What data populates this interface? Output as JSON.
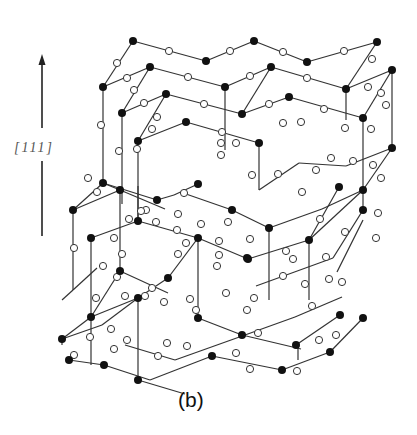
{
  "figure": {
    "caption": "(b)",
    "axis_label": "[111]",
    "colors": {
      "line": "#333333",
      "black_atom": "#111111",
      "white_atom_fill": "#ffffff",
      "white_atom_stroke": "#333333"
    }
  },
  "arrow": {
    "x": 42,
    "y_top": 54,
    "y_gap_top": 128,
    "y_gap_bottom": 161,
    "y_bottom": 236
  },
  "bonds": [
    [
      133,
      41,
      103,
      87
    ],
    [
      133,
      41,
      206,
      61
    ],
    [
      206,
      61,
      254,
      41
    ],
    [
      254,
      41,
      307,
      62
    ],
    [
      307,
      62,
      377,
      42
    ],
    [
      103,
      87,
      150,
      67
    ],
    [
      150,
      67,
      225,
      87
    ],
    [
      225,
      87,
      271,
      67
    ],
    [
      271,
      67,
      346,
      89
    ],
    [
      346,
      89,
      377,
      42
    ],
    [
      346,
      89,
      392,
      70
    ],
    [
      150,
      67,
      122,
      113
    ],
    [
      122,
      113,
      166,
      94
    ],
    [
      166,
      94,
      242,
      114
    ],
    [
      242,
      114,
      289,
      97
    ],
    [
      289,
      97,
      363,
      118
    ],
    [
      363,
      118,
      392,
      70
    ],
    [
      166,
      94,
      138,
      141
    ],
    [
      138,
      141,
      186,
      122
    ],
    [
      186,
      122,
      259,
      143
    ],
    [
      271,
      67,
      242,
      114
    ],
    [
      103,
      87,
      103,
      183
    ],
    [
      122,
      113,
      122,
      204
    ],
    [
      138,
      141,
      138,
      221
    ],
    [
      363,
      118,
      363,
      190
    ],
    [
      392,
      70,
      392,
      148
    ],
    [
      346,
      89,
      346,
      120
    ],
    [
      259,
      143,
      259,
      160
    ],
    [
      225,
      87,
      225,
      150
    ],
    [
      103,
      183,
      73,
      210
    ],
    [
      103,
      183,
      157,
      200
    ],
    [
      157,
      200,
      174,
      195
    ],
    [
      174,
      195,
      198,
      184
    ],
    [
      73,
      210,
      120,
      190
    ],
    [
      120,
      190,
      165,
      209
    ],
    [
      120,
      190,
      103,
      183
    ],
    [
      73,
      210,
      73,
      290
    ],
    [
      120,
      190,
      120,
      271
    ],
    [
      138,
      221,
      138,
      186
    ],
    [
      138,
      221,
      91,
      238
    ],
    [
      91,
      238,
      91,
      317
    ],
    [
      138,
      221,
      198,
      238
    ],
    [
      198,
      238,
      248,
      259
    ],
    [
      248,
      259,
      309,
      240
    ],
    [
      309,
      240,
      363,
      190
    ],
    [
      186,
      194,
      232,
      210
    ],
    [
      232,
      210,
      269,
      228
    ],
    [
      269,
      228,
      322,
      209
    ],
    [
      322,
      209,
      363,
      190
    ],
    [
      269,
      228,
      269,
      300
    ],
    [
      259,
      160,
      259,
      190
    ],
    [
      259,
      190,
      299,
      163
    ],
    [
      299,
      163,
      346,
      166
    ],
    [
      346,
      166,
      392,
      148
    ],
    [
      392,
      148,
      363,
      190
    ],
    [
      309,
      240,
      339,
      187
    ],
    [
      363,
      190,
      363,
      210
    ],
    [
      309,
      240,
      309,
      300
    ],
    [
      363,
      210,
      333,
      258
    ],
    [
      333,
      258,
      256,
      286
    ],
    [
      120,
      271,
      91,
      317
    ],
    [
      91,
      317,
      138,
      298
    ],
    [
      138,
      298,
      168,
      278
    ],
    [
      168,
      278,
      198,
      238
    ],
    [
      198,
      238,
      198,
      318
    ],
    [
      120,
      271,
      168,
      293
    ],
    [
      73,
      290,
      97,
      268
    ],
    [
      73,
      290,
      62,
      300
    ],
    [
      91,
      317,
      62,
      339
    ],
    [
      62,
      339,
      102,
      325
    ],
    [
      102,
      325,
      138,
      298
    ],
    [
      138,
      298,
      138,
      380
    ],
    [
      91,
      317,
      91,
      365
    ],
    [
      62,
      339,
      62,
      345
    ],
    [
      125,
      345,
      175,
      360
    ],
    [
      175,
      360,
      245,
      335
    ],
    [
      245,
      335,
      295,
      317
    ],
    [
      295,
      317,
      342,
      297
    ],
    [
      138,
      380,
      185,
      394
    ],
    [
      198,
      318,
      242,
      335
    ],
    [
      242,
      335,
      301,
      349
    ],
    [
      104,
      365,
      150,
      380
    ],
    [
      150,
      380,
      212,
      356
    ],
    [
      296,
      345,
      340,
      315
    ],
    [
      298,
      348,
      298,
      360
    ],
    [
      212,
      356,
      282,
      370
    ],
    [
      282,
      370,
      330,
      352
    ],
    [
      330,
      352,
      363,
      318
    ],
    [
      69,
      360,
      104,
      365
    ],
    [
      337,
      272,
      363,
      220
    ]
  ],
  "black_atoms": [
    [
      133,
      41
    ],
    [
      206,
      61
    ],
    [
      254,
      41
    ],
    [
      307,
      62
    ],
    [
      377,
      42
    ],
    [
      103,
      87
    ],
    [
      150,
      67
    ],
    [
      225,
      87
    ],
    [
      271,
      67
    ],
    [
      346,
      89
    ],
    [
      392,
      70
    ],
    [
      122,
      113
    ],
    [
      166,
      94
    ],
    [
      242,
      114
    ],
    [
      289,
      97
    ],
    [
      363,
      118
    ],
    [
      138,
      141
    ],
    [
      186,
      122
    ],
    [
      259,
      143
    ],
    [
      103,
      183
    ],
    [
      157,
      200
    ],
    [
      232,
      210
    ],
    [
      339,
      187
    ],
    [
      363,
      190
    ],
    [
      73,
      210
    ],
    [
      120,
      190
    ],
    [
      198,
      184
    ],
    [
      269,
      228
    ],
    [
      392,
      148
    ],
    [
      91,
      238
    ],
    [
      138,
      221
    ],
    [
      198,
      238
    ],
    [
      248,
      259
    ],
    [
      363,
      210
    ],
    [
      138,
      298
    ],
    [
      309,
      240
    ],
    [
      247,
      258
    ],
    [
      120,
      271
    ],
    [
      198,
      318
    ],
    [
      296,
      345
    ],
    [
      62,
      339
    ],
    [
      168,
      278
    ],
    [
      242,
      335
    ],
    [
      340,
      315
    ],
    [
      91,
      317
    ],
    [
      212,
      356
    ],
    [
      363,
      318
    ],
    [
      69,
      360
    ],
    [
      104,
      365
    ],
    [
      138,
      380
    ],
    [
      282,
      370
    ],
    [
      330,
      352
    ]
  ],
  "white_atoms": [
    [
      117,
      63
    ],
    [
      169,
      51
    ],
    [
      230,
      51
    ],
    [
      283,
      52
    ],
    [
      344,
      51
    ],
    [
      127,
      78
    ],
    [
      188,
      77
    ],
    [
      250,
      76
    ],
    [
      307,
      78
    ],
    [
      372,
      59
    ],
    [
      134,
      90
    ],
    [
      144,
      103
    ],
    [
      204,
      104
    ],
    [
      269,
      104
    ],
    [
      324,
      109
    ],
    [
      368,
      87
    ],
    [
      381,
      93
    ],
    [
      152,
      129
    ],
    [
      157,
      117
    ],
    [
      222,
      132
    ],
    [
      301,
      122
    ],
    [
      386,
      105
    ],
    [
      101,
      125
    ],
    [
      119,
      151
    ],
    [
      221,
      143
    ],
    [
      221,
      155
    ],
    [
      283,
      123
    ],
    [
      345,
      128
    ],
    [
      371,
      129
    ],
    [
      88,
      178
    ],
    [
      97,
      192
    ],
    [
      137,
      149
    ],
    [
      146,
      210
    ],
    [
      141,
      211
    ],
    [
      156,
      222
    ],
    [
      184,
      193
    ],
    [
      186,
      243
    ],
    [
      236,
      143
    ],
    [
      178,
      214
    ],
    [
      228,
      222
    ],
    [
      252,
      175
    ],
    [
      278,
      174
    ],
    [
      302,
      192
    ],
    [
      316,
      170
    ],
    [
      331,
      158
    ],
    [
      353,
      161
    ],
    [
      373,
      165
    ],
    [
      381,
      178
    ],
    [
      74,
      248
    ],
    [
      114,
      238
    ],
    [
      129,
      219
    ],
    [
      177,
      230
    ],
    [
      201,
      224
    ],
    [
      219,
      241
    ],
    [
      250,
      239
    ],
    [
      293,
      259
    ],
    [
      320,
      219
    ],
    [
      345,
      232
    ],
    [
      376,
      238
    ],
    [
      122,
      254
    ],
    [
      178,
      254
    ],
    [
      219,
      255
    ],
    [
      286,
      251
    ],
    [
      326,
      257
    ],
    [
      378,
      213
    ],
    [
      103,
      266
    ],
    [
      117,
      277
    ],
    [
      152,
      288
    ],
    [
      125,
      296
    ],
    [
      164,
      302
    ],
    [
      190,
      299
    ],
    [
      217,
      266
    ],
    [
      226,
      293
    ],
    [
      254,
      298
    ],
    [
      283,
      276
    ],
    [
      305,
      284
    ],
    [
      329,
      279
    ],
    [
      342,
      282
    ],
    [
      96,
      298
    ],
    [
      111,
      329
    ],
    [
      145,
      296
    ],
    [
      167,
      343
    ],
    [
      196,
      310
    ],
    [
      247,
      310
    ],
    [
      258,
      333
    ],
    [
      312,
      306
    ],
    [
      74,
      355
    ],
    [
      90,
      337
    ],
    [
      127,
      340
    ],
    [
      114,
      349
    ],
    [
      158,
      356
    ],
    [
      187,
      346
    ],
    [
      236,
      353
    ],
    [
      250,
      369
    ],
    [
      297,
      371
    ],
    [
      319,
      340
    ],
    [
      336,
      335
    ]
  ]
}
